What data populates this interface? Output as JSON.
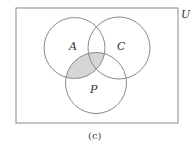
{
  "diagram": {
    "type": "venn",
    "universe_label": "U",
    "caption": "(c)",
    "sets": [
      {
        "name": "A",
        "label": "A"
      },
      {
        "name": "C",
        "label": "C"
      },
      {
        "name": "P",
        "label": "P"
      }
    ],
    "shaded_region": "A ∩ P",
    "colors": {
      "stroke": "#8a8a8a",
      "shade": "#d6d6d6",
      "background": "#ffffff"
    }
  }
}
